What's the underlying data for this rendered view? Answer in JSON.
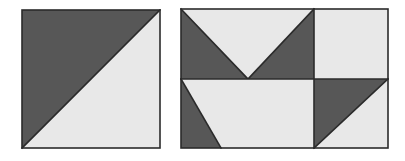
{
  "canvas": {
    "width": 405,
    "height": 161,
    "background_color": "#ffffff"
  },
  "palette": {
    "dark": "#575757",
    "light": "#e8e8e8",
    "outline": "#2b2b2b",
    "background": "#ffffff"
  },
  "figures": [
    {
      "id": "left-block",
      "name": "half-square-triangle-block",
      "shape": "square",
      "x": 22,
      "y": 10,
      "width": 138,
      "height": 138,
      "description": "Square divided by a diagonal from top-right to bottom-left; upper-left half dark, lower-right half light.",
      "regions": [
        {
          "name": "upper-left-triangle",
          "fill": "dark",
          "points": "22,10 160,10 22,148"
        },
        {
          "name": "lower-right-triangle",
          "fill": "light",
          "points": "160,10 160,148 22,148"
        }
      ]
    },
    {
      "id": "right-block",
      "name": "four-quadrant-pinwheel-block",
      "shape": "rectangle",
      "x": 181,
      "y": 9,
      "width": 207,
      "height": 139,
      "description": "Rectangle divided into four quadrants by one vertical and one horizontal line; each quadrant carries a triangular light/dark motif.",
      "divider_x": 314,
      "divider_y": 79,
      "quadrants": [
        {
          "name": "top-left-quadrant",
          "bounds": {
            "x": 181,
            "y": 9,
            "width": 133,
            "height": 70
          },
          "motif": "inverted-v-light-triangle",
          "regions": [
            {
              "name": "left-dark-triangle",
              "fill": "dark",
              "points": "181,9 181,79 248,79"
            },
            {
              "name": "center-light-triangle",
              "fill": "light",
              "points": "181,9 314,9 248,79"
            },
            {
              "name": "right-dark-triangle",
              "fill": "dark",
              "points": "314,9 314,79 248,79"
            }
          ]
        },
        {
          "name": "top-right-quadrant",
          "bounds": {
            "x": 314,
            "y": 9,
            "width": 74,
            "height": 70
          },
          "motif": "solid-light-square",
          "regions": [
            {
              "name": "light-square",
              "fill": "light",
              "points": "314,9 388,9 388,79 314,79"
            }
          ]
        },
        {
          "name": "bottom-left-quadrant",
          "bounds": {
            "x": 181,
            "y": 79,
            "width": 133,
            "height": 69
          },
          "motif": "diagonal-light-triangle",
          "regions": [
            {
              "name": "upper-light-triangle",
              "fill": "light",
              "points": "181,79 314,79 314,148 221,148"
            },
            {
              "name": "lower-dark-triangle",
              "fill": "dark",
              "points": "181,79 221,148 181,148"
            }
          ]
        },
        {
          "name": "bottom-right-quadrant",
          "bounds": {
            "x": 314,
            "y": 79,
            "width": 74,
            "height": 69
          },
          "motif": "half-square-triangle",
          "regions": [
            {
              "name": "upper-left-dark-triangle",
              "fill": "dark",
              "points": "314,79 388,79 314,148"
            },
            {
              "name": "lower-right-light-triangle",
              "fill": "light",
              "points": "388,79 388,148 314,148"
            }
          ]
        }
      ]
    }
  ]
}
